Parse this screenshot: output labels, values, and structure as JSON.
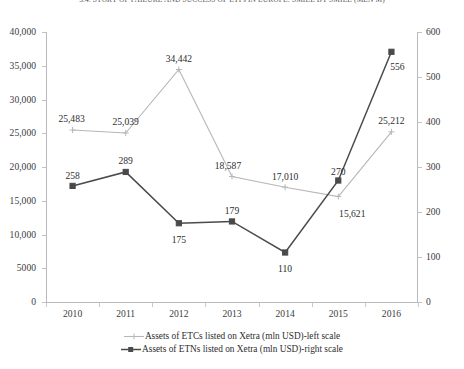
{
  "chart_data": {
    "type": "line",
    "title": "3.4. STORY OF FAILURE AND SUCCESS OF ETFs IN EUROPE: SMILE BY SMILE (MLN M)",
    "xlabel": "",
    "ylabel": "",
    "categories": [
      "2010",
      "2011",
      "2012",
      "2013",
      "2014",
      "2015",
      "2016"
    ],
    "series": [
      {
        "name": "Assets of ETCs listed on Xetra (mln USD)-left scale",
        "axis": "left",
        "color": "#b7b7b7",
        "marker": "plus",
        "values": [
          25483,
          25039,
          34442,
          18587,
          17010,
          15621,
          25212
        ],
        "labels": [
          "25,483",
          "25,039",
          "34,442",
          "18,587",
          "17,010",
          "15,621",
          "25,212"
        ]
      },
      {
        "name": "Assets of ETNs listed on Xetra (mln USD)-right scale",
        "axis": "right",
        "color": "#4a4a4a",
        "marker": "square",
        "values": [
          258,
          289,
          175,
          179,
          110,
          270,
          556
        ],
        "labels": [
          "258",
          "289",
          "175",
          "179",
          "110",
          "270",
          "556"
        ]
      }
    ],
    "axes": {
      "left": {
        "min": 0,
        "max": 40000,
        "ticks": [
          0,
          5000,
          10000,
          15000,
          20000,
          25000,
          30000,
          35000,
          40000
        ],
        "tick_labels": [
          "0",
          "5000",
          "10,000",
          "15,000",
          "20,000",
          "25,000",
          "30,000",
          "35,000",
          "40,000"
        ]
      },
      "right": {
        "min": 0,
        "max": 600,
        "ticks": [
          0,
          100,
          200,
          300,
          400,
          500,
          600
        ],
        "tick_labels": [
          "0",
          "100",
          "200",
          "300",
          "400",
          "500",
          "600"
        ]
      }
    },
    "grid": false,
    "legend_position": "bottom"
  },
  "legend": {
    "entries": [
      "Assets of ETCs listed on Xetra (mln USD)-left scale",
      "Assets of ETNs listed on Xetra (mln USD)-right scale"
    ]
  }
}
